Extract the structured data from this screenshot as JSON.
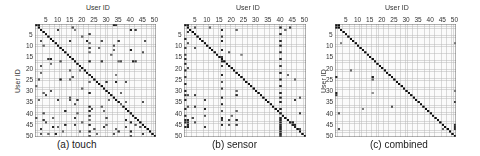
{
  "chart_data": [
    {
      "type": "heatmap",
      "title": "(a) touch",
      "xlabel": "User ID",
      "ylabel": "User ID",
      "x_ticks": [
        5,
        10,
        15,
        20,
        25,
        30,
        35,
        40,
        45,
        50
      ],
      "y_ticks": [
        5,
        10,
        15,
        20,
        25,
        30,
        35,
        40,
        45,
        50
      ],
      "size": 50,
      "grid": true,
      "diagonal": 1.0,
      "cells": [
        [
          1,
          1,
          1
        ],
        [
          1,
          2,
          0.9
        ],
        [
          1,
          33,
          0.9
        ],
        [
          1,
          34,
          0.8
        ],
        [
          2,
          16,
          0.7
        ],
        [
          3,
          10,
          0.8
        ],
        [
          3,
          17,
          0.5
        ],
        [
          3,
          40,
          0.9
        ],
        [
          3,
          42,
          0.8
        ],
        [
          5,
          23,
          0.8
        ],
        [
          6,
          20,
          0.6
        ],
        [
          8,
          3,
          0.7
        ],
        [
          8,
          15,
          0.8
        ],
        [
          8,
          22,
          0.9
        ],
        [
          8,
          28,
          0.7
        ],
        [
          8,
          35,
          0.8
        ],
        [
          8,
          46,
          0.7
        ],
        [
          9,
          23,
          0.6
        ],
        [
          10,
          4,
          0.6
        ],
        [
          10,
          33,
          0.7
        ],
        [
          11,
          23,
          0.8
        ],
        [
          11,
          27,
          0.6
        ],
        [
          12,
          33,
          0.6
        ],
        [
          12,
          40,
          0.9
        ],
        [
          13,
          23,
          0.6
        ],
        [
          13,
          45,
          0.7
        ],
        [
          14,
          32,
          0.6
        ],
        [
          16,
          6,
          0.8
        ],
        [
          16,
          7,
          0.9
        ],
        [
          17,
          11,
          0.7
        ],
        [
          17,
          23,
          0.9
        ],
        [
          17,
          28,
          0.8
        ],
        [
          17,
          36,
          0.7
        ],
        [
          17,
          41,
          0.9
        ],
        [
          17,
          42,
          0.8
        ],
        [
          17,
          35,
          0.6
        ],
        [
          18,
          7,
          0.6
        ],
        [
          19,
          3,
          0.7
        ],
        [
          21,
          15,
          0.6
        ],
        [
          21,
          19,
          0.5
        ],
        [
          22,
          3,
          0.6
        ],
        [
          23,
          23,
          0.9
        ],
        [
          23,
          34,
          0.5
        ],
        [
          24,
          16,
          0.7
        ],
        [
          25,
          2,
          0.7
        ],
        [
          25,
          11,
          0.9
        ],
        [
          25,
          15,
          0.6
        ],
        [
          26,
          23,
          0.6
        ],
        [
          26,
          30,
          0.8
        ],
        [
          26,
          34,
          0.9
        ],
        [
          26,
          38,
          0.7
        ],
        [
          28,
          1,
          0.6
        ],
        [
          29,
          20,
          0.6
        ],
        [
          30,
          7,
          0.7
        ],
        [
          31,
          4,
          0.6
        ],
        [
          31,
          23,
          0.9
        ],
        [
          31,
          36,
          0.6
        ],
        [
          32,
          5,
          0.8
        ],
        [
          33,
          15,
          0.7
        ],
        [
          34,
          2,
          0.6
        ],
        [
          34,
          10,
          0.8
        ],
        [
          34,
          15,
          0.7
        ],
        [
          34,
          18,
          0.8
        ],
        [
          34,
          31,
          0.6
        ],
        [
          35,
          38,
          0.6
        ],
        [
          35,
          45,
          0.7
        ],
        [
          36,
          17,
          0.7
        ],
        [
          36,
          36,
          0.6
        ],
        [
          37,
          23,
          0.9
        ],
        [
          37,
          28,
          0.6
        ],
        [
          38,
          24,
          0.7
        ],
        [
          39,
          13,
          0.9
        ],
        [
          39,
          23,
          0.9
        ],
        [
          39,
          29,
          0.6
        ],
        [
          40,
          4,
          0.7
        ],
        [
          40,
          18,
          0.6
        ],
        [
          40,
          40,
          0.9
        ],
        [
          41,
          23,
          0.8
        ],
        [
          42,
          1,
          0.7
        ],
        [
          42,
          8,
          0.6
        ],
        [
          42,
          17,
          0.8
        ],
        [
          42,
          30,
          0.7
        ],
        [
          43,
          4,
          0.8
        ],
        [
          43,
          23,
          0.6
        ],
        [
          43,
          38,
          0.9
        ],
        [
          44,
          5,
          0.7
        ],
        [
          44,
          20,
          0.6
        ],
        [
          44,
          40,
          0.9
        ],
        [
          45,
          13,
          0.9
        ],
        [
          45,
          17,
          0.8
        ],
        [
          45,
          23,
          0.9
        ],
        [
          45,
          30,
          0.6
        ],
        [
          45,
          42,
          0.7
        ],
        [
          46,
          8,
          0.9
        ],
        [
          46,
          10,
          0.6
        ],
        [
          46,
          29,
          0.8
        ],
        [
          46,
          38,
          0.7
        ],
        [
          46,
          44,
          0.7
        ],
        [
          47,
          3,
          0.8
        ],
        [
          47,
          25,
          0.7
        ],
        [
          47,
          34,
          0.6
        ],
        [
          48,
          12,
          0.6
        ],
        [
          48,
          19,
          0.6
        ],
        [
          48,
          23,
          0.9
        ],
        [
          48,
          35,
          0.8
        ],
        [
          48,
          40,
          0.9
        ],
        [
          49,
          3,
          0.7
        ],
        [
          49,
          6,
          0.6
        ],
        [
          49,
          9,
          0.9
        ],
        [
          49,
          26,
          0.6
        ],
        [
          49,
          33,
          0.7
        ],
        [
          49,
          45,
          0.8
        ],
        [
          50,
          23,
          0.7
        ],
        [
          50,
          40,
          0.7
        ]
      ]
    },
    {
      "type": "heatmap",
      "title": "(b) sensor",
      "xlabel": "User ID",
      "ylabel": "",
      "x_ticks": [
        5,
        10,
        15,
        20,
        25,
        30,
        35,
        40,
        45,
        50
      ],
      "y_ticks": [
        5,
        10,
        15,
        20,
        25,
        30,
        35,
        40,
        45,
        50
      ],
      "size": 50,
      "grid": true,
      "diagonal": 1.0,
      "cells": [
        [
          1,
          1,
          1
        ],
        [
          1,
          2,
          0.9
        ],
        [
          2,
          5,
          0.7
        ],
        [
          2,
          11,
          0.6
        ],
        [
          2,
          40,
          0.9
        ],
        [
          2,
          44,
          0.8
        ],
        [
          3,
          16,
          0.9
        ],
        [
          3,
          22,
          0.6
        ],
        [
          3,
          42,
          0.6
        ],
        [
          4,
          2,
          0.8
        ],
        [
          5,
          40,
          0.9
        ],
        [
          6,
          16,
          0.8
        ],
        [
          7,
          1,
          0.9
        ],
        [
          8,
          16,
          0.9
        ],
        [
          8,
          40,
          0.9
        ],
        [
          9,
          2,
          0.7
        ],
        [
          10,
          40,
          0.9
        ],
        [
          11,
          1,
          0.8
        ],
        [
          11,
          5,
          0.7
        ],
        [
          12,
          16,
          0.9
        ],
        [
          13,
          40,
          0.9
        ],
        [
          13,
          19,
          0.7
        ],
        [
          14,
          1,
          0.8
        ],
        [
          14,
          24,
          0.5
        ],
        [
          15,
          16,
          0.8
        ],
        [
          16,
          1,
          0.9
        ],
        [
          16,
          40,
          0.9
        ],
        [
          17,
          16,
          0.9
        ],
        [
          18,
          1,
          0.9
        ],
        [
          19,
          16,
          0.8
        ],
        [
          19,
          40,
          0.8
        ],
        [
          20,
          2,
          0.7
        ],
        [
          21,
          1,
          0.9
        ],
        [
          22,
          40,
          0.9
        ],
        [
          23,
          16,
          0.9
        ],
        [
          23,
          43,
          0.6
        ],
        [
          24,
          1,
          0.8
        ],
        [
          25,
          40,
          0.9
        ],
        [
          25,
          46,
          0.6
        ],
        [
          26,
          16,
          0.7
        ],
        [
          27,
          1,
          0.9
        ],
        [
          28,
          40,
          0.9
        ],
        [
          29,
          16,
          0.8
        ],
        [
          30,
          1,
          0.9
        ],
        [
          30,
          22,
          0.6
        ],
        [
          31,
          40,
          0.9
        ],
        [
          32,
          1,
          0.9
        ],
        [
          32,
          2,
          0.7
        ],
        [
          32,
          5,
          0.8
        ],
        [
          32,
          22,
          0.9
        ],
        [
          33,
          16,
          0.9
        ],
        [
          33,
          40,
          0.9
        ],
        [
          33,
          48,
          0.7
        ],
        [
          34,
          1,
          0.9
        ],
        [
          34,
          9,
          0.8
        ],
        [
          34,
          46,
          0.8
        ],
        [
          35,
          40,
          0.9
        ],
        [
          36,
          16,
          0.9
        ],
        [
          37,
          2,
          0.7
        ],
        [
          37,
          5,
          0.8
        ],
        [
          38,
          1,
          0.9
        ],
        [
          38,
          9,
          0.9
        ],
        [
          38,
          40,
          0.9
        ],
        [
          39,
          16,
          0.7
        ],
        [
          39,
          22,
          0.6
        ],
        [
          40,
          40,
          0.9
        ],
        [
          40,
          48,
          0.8
        ],
        [
          41,
          1,
          0.9
        ],
        [
          41,
          9,
          0.7
        ],
        [
          41,
          20,
          0.6
        ],
        [
          42,
          16,
          0.9
        ],
        [
          42,
          40,
          0.9
        ],
        [
          42,
          4,
          0.7
        ],
        [
          43,
          1,
          0.9
        ],
        [
          43,
          2,
          0.9
        ],
        [
          43,
          16,
          0.8
        ],
        [
          43,
          19,
          0.8
        ],
        [
          43,
          22,
          0.9
        ],
        [
          43,
          40,
          0.9
        ],
        [
          44,
          1,
          0.9
        ],
        [
          44,
          2,
          0.8
        ],
        [
          44,
          5,
          0.7
        ],
        [
          44,
          40,
          0.9
        ],
        [
          44,
          44,
          0.9
        ],
        [
          44,
          45,
          0.9
        ],
        [
          45,
          2,
          0.9
        ],
        [
          45,
          16,
          0.9
        ],
        [
          45,
          19,
          0.7
        ],
        [
          45,
          22,
          0.8
        ],
        [
          45,
          40,
          0.9
        ],
        [
          45,
          45,
          0.9
        ],
        [
          45,
          46,
          0.9
        ],
        [
          46,
          1,
          0.9
        ],
        [
          46,
          2,
          0.9
        ],
        [
          46,
          9,
          0.8
        ],
        [
          46,
          40,
          0.9
        ],
        [
          46,
          46,
          0.9
        ],
        [
          47,
          40,
          0.9
        ],
        [
          47,
          48,
          0.7
        ],
        [
          48,
          40,
          0.9
        ],
        [
          49,
          40,
          0.9
        ],
        [
          50,
          40,
          0.8
        ]
      ]
    },
    {
      "type": "heatmap",
      "title": "(c) combined",
      "xlabel": "User ID",
      "ylabel": "User ID",
      "x_ticks": [
        5,
        10,
        15,
        20,
        25,
        30,
        35,
        40,
        45,
        50
      ],
      "y_ticks": [
        5,
        10,
        15,
        20,
        25,
        30,
        35,
        40,
        45,
        50
      ],
      "size": 50,
      "grid": true,
      "diagonal": 1.0,
      "cells": [
        [
          1,
          1,
          1
        ],
        [
          1,
          2,
          1
        ],
        [
          2,
          1,
          1
        ],
        [
          2,
          2,
          1
        ],
        [
          9,
          3,
          0.5
        ],
        [
          9,
          50,
          0.5
        ],
        [
          21,
          7,
          0.6
        ],
        [
          24,
          1,
          0.9
        ],
        [
          24,
          16,
          0.9
        ],
        [
          25,
          16,
          0.6
        ],
        [
          30,
          50,
          0.5
        ],
        [
          31,
          1,
          0.9
        ],
        [
          32,
          1,
          0.8
        ],
        [
          31,
          16,
          0.4
        ],
        [
          35,
          50,
          0.8
        ],
        [
          37,
          24,
          0.7
        ],
        [
          38,
          12,
          0.5
        ],
        [
          40,
          2,
          0.7
        ],
        [
          45,
          50,
          0.9
        ],
        [
          46,
          50,
          0.9
        ],
        [
          47,
          2,
          0.7
        ],
        [
          47,
          45,
          0.6
        ],
        [
          47,
          50,
          0.9
        ]
      ]
    }
  ],
  "panels": [
    {
      "caption": "(a) touch",
      "x_title": "User ID",
      "y_title": "User ID"
    },
    {
      "caption": "(b) sensor",
      "x_title": "User ID",
      "y_title": "User ID"
    },
    {
      "caption": "(c) combined",
      "x_title": "User ID",
      "y_title": "User ID"
    }
  ],
  "ticks": [
    "5",
    "10",
    "15",
    "20",
    "25",
    "30",
    "35",
    "40",
    "45",
    "50"
  ]
}
